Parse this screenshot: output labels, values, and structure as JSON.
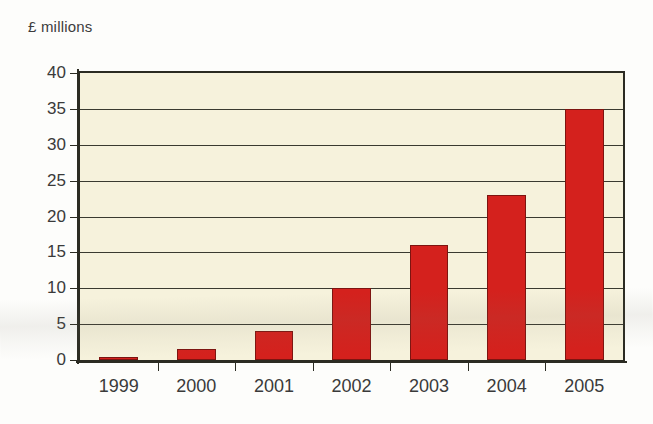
{
  "chart_data": {
    "type": "bar",
    "title": "£ millions",
    "xlabel": "",
    "ylabel": "£ millions",
    "categories": [
      "1999",
      "2000",
      "2001",
      "2002",
      "2003",
      "2004",
      "2005"
    ],
    "values": [
      0.4,
      1.5,
      4,
      10,
      16,
      23,
      35
    ],
    "series": [
      {
        "name": "£ millions",
        "values": [
          0.4,
          1.5,
          4,
          10,
          16,
          23,
          35
        ]
      }
    ],
    "ylim": [
      0,
      40
    ],
    "yticks": [
      0,
      5,
      10,
      15,
      20,
      25,
      30,
      35,
      40
    ],
    "ytick_labels": [
      "0",
      "5",
      "10",
      "15",
      "20",
      "25",
      "30",
      "35",
      "40"
    ],
    "grid": true,
    "grid_axis": "y",
    "legend": false,
    "legend_position": "none",
    "bar_color": "#d4211d",
    "bar_edge_color": "#7d1410",
    "plot_background": "#f6f2dc",
    "page_background": "#fdfdfb",
    "axis_color": "#2b2b22",
    "text_color": "#3a3a3a"
  }
}
